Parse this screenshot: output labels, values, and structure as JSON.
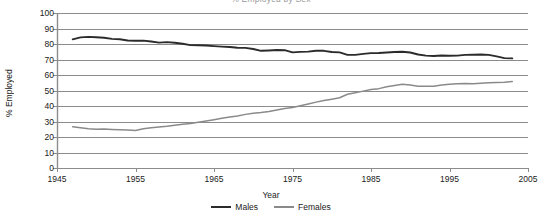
{
  "figure": {
    "clipped_top_text": "% Employed by Sex",
    "x_axis_title": "Year",
    "y_axis_title": "% Employed"
  },
  "legend": {
    "position": "bottom-center",
    "items": [
      {
        "label": "Males",
        "color": "#2b2b2b"
      },
      {
        "label": "Females",
        "color": "#8a8a8a"
      }
    ]
  },
  "colors": {
    "males": "#2b2b2b",
    "females": "#8a8a8a",
    "gridline": "#8c8c8c",
    "axis": "#8c8c8c",
    "text": "#1a1a1a",
    "background": "#ffffff"
  },
  "axes": {
    "y_ticks": [
      "0",
      "10",
      "20",
      "30",
      "40",
      "50",
      "60",
      "70",
      "80",
      "90",
      "100"
    ],
    "x_ticks": [
      "1945",
      "1955",
      "1965",
      "1975",
      "1985",
      "1995",
      "2005"
    ]
  },
  "chart_data": {
    "type": "line",
    "title": "% Employed by Sex",
    "xlabel": "Year",
    "ylabel": "% Employed",
    "xlim": [
      1945,
      2005
    ],
    "ylim": [
      0,
      100
    ],
    "ytick_interval": 10,
    "xtick_interval": 10,
    "grid": "horizontal",
    "legend_position": "bottom-center",
    "x": [
      1947,
      1948,
      1949,
      1950,
      1951,
      1952,
      1953,
      1954,
      1955,
      1956,
      1957,
      1958,
      1959,
      1960,
      1961,
      1962,
      1963,
      1964,
      1965,
      1966,
      1967,
      1968,
      1969,
      1970,
      1971,
      1972,
      1973,
      1974,
      1975,
      1976,
      1977,
      1978,
      1979,
      1980,
      1981,
      1982,
      1983,
      1984,
      1985,
      1986,
      1987,
      1988,
      1989,
      1990,
      1991,
      1992,
      1993,
      1994,
      1995,
      1996,
      1997,
      1998,
      1999,
      2000,
      2001,
      2002,
      2003
    ],
    "series": [
      {
        "name": "Males",
        "color": "#2b2b2b",
        "values": [
          83.0,
          84.3,
          84.6,
          84.4,
          84.0,
          83.3,
          83.1,
          82.3,
          82.1,
          82.2,
          81.6,
          80.9,
          81.2,
          80.8,
          80.2,
          79.3,
          79.2,
          79.0,
          78.6,
          78.3,
          78.1,
          77.6,
          77.5,
          76.8,
          75.6,
          75.8,
          76.1,
          76.0,
          74.6,
          74.9,
          75.1,
          75.6,
          75.6,
          74.8,
          74.6,
          73.0,
          73.0,
          73.6,
          74.1,
          74.2,
          74.5,
          74.8,
          75.0,
          74.5,
          73.2,
          72.5,
          72.3,
          72.6,
          72.4,
          72.5,
          73.0,
          73.1,
          73.2,
          73.0,
          72.0,
          70.9,
          70.7
        ]
      },
      {
        "name": "Females",
        "color": "#8a8a8a",
        "values": [
          26.6,
          26.0,
          25.3,
          25.0,
          25.1,
          24.9,
          24.7,
          24.5,
          24.2,
          25.3,
          26.0,
          26.4,
          26.9,
          27.6,
          28.2,
          28.7,
          29.5,
          30.3,
          31.2,
          32.1,
          32.9,
          33.6,
          34.6,
          35.3,
          35.8,
          36.5,
          37.4,
          38.4,
          39.0,
          40.2,
          41.3,
          42.5,
          43.6,
          44.4,
          45.3,
          47.6,
          48.6,
          49.6,
          50.7,
          51.2,
          52.4,
          53.2,
          54.0,
          53.5,
          52.8,
          52.7,
          52.8,
          53.5,
          54.0,
          54.3,
          54.5,
          54.3,
          54.6,
          55.0,
          55.2,
          55.4,
          55.8
        ]
      }
    ]
  },
  "geometry": {
    "plot_left": 57,
    "plot_right": 528,
    "plot_top": 13,
    "plot_bottom": 168
  }
}
